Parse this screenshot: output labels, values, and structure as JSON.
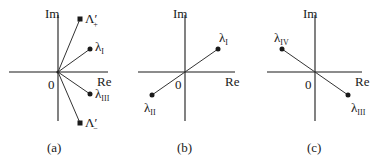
{
  "axes_labels": {
    "im": "Im",
    "re": "Re",
    "origin": "0"
  },
  "panels": [
    {
      "caption": "(a)",
      "points": [
        {
          "name": "Λ",
          "prime": "′",
          "sub": "+",
          "marker": "square"
        },
        {
          "name": "λ",
          "sub": "I",
          "marker": "dot"
        },
        {
          "name": "λ",
          "sub": "III",
          "marker": "dot"
        },
        {
          "name": "Λ",
          "prime": "′",
          "sub": "−",
          "marker": "square"
        }
      ]
    },
    {
      "caption": "(b)",
      "points": [
        {
          "name": "λ",
          "sub": "I",
          "marker": "dot"
        },
        {
          "name": "λ",
          "sub": "II",
          "marker": "dot"
        }
      ]
    },
    {
      "caption": "(c)",
      "points": [
        {
          "name": "λ",
          "sub": "IV",
          "marker": "dot"
        },
        {
          "name": "λ",
          "sub": "III",
          "marker": "dot"
        }
      ]
    }
  ]
}
